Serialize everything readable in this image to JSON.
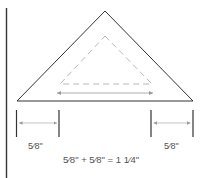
{
  "diagram": {
    "labels": {
      "left_allowance": "5⁄8\"",
      "right_allowance": "5⁄8\"",
      "equation": "5⁄8\" + 5⁄8\" = 1 1⁄4\""
    },
    "colors": {
      "outline": "#333333",
      "dashed": "#b8b8b8",
      "arrow": "#999999",
      "text": "#555555",
      "margin_rule": "#333333"
    },
    "shapes": {
      "outer_triangle": "cut edge",
      "inner_triangle": "seam line (dashed)",
      "base_arrow": "finished width",
      "left_measure": "seam allowance left",
      "right_measure": "seam allowance right"
    }
  }
}
